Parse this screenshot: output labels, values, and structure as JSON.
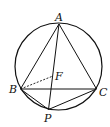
{
  "diagram": {
    "type": "geometry",
    "points": {
      "A": {
        "label": "A",
        "x": 59,
        "y": 24
      },
      "B": {
        "label": "B",
        "x": 20.5,
        "y": 89
      },
      "C": {
        "label": "C",
        "x": 96.5,
        "y": 89
      },
      "P": {
        "label": "P",
        "x": 48.5,
        "y": 109.5
      },
      "F": {
        "label": "F",
        "x": 53,
        "y": 76
      }
    },
    "circle": {
      "cx": 58.5,
      "cy": 66.5,
      "r": 43.5
    },
    "segments": [
      "AB",
      "AC",
      "BC",
      "AP",
      "BP",
      "CP"
    ],
    "dashed_segments": [
      "BF"
    ],
    "colors": {
      "stroke": "#111111",
      "background": "#ffffff"
    }
  }
}
